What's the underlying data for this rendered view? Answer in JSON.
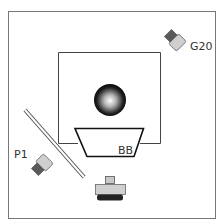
{
  "diagram": {
    "type": "optical-setup",
    "colors": {
      "frame": "#777777",
      "light_body": "#cfcfcf",
      "dark_body": "#5a5a5a",
      "detector_base": "#222222",
      "sphere_dark": "#000000",
      "sphere_light": "#ffffff",
      "trapezoid_stroke": "#111111"
    },
    "labels": {
      "camera_top_right": "G20",
      "camera_left": "P1",
      "trapezoid": "BB"
    },
    "components": [
      {
        "id": "outer-frame",
        "kind": "enclosure"
      },
      {
        "id": "inner-box",
        "kind": "chamber"
      },
      {
        "id": "sphere",
        "kind": "target-sphere"
      },
      {
        "id": "trapezoid",
        "kind": "blackbody",
        "label": "BB"
      },
      {
        "id": "mirror",
        "kind": "diagonal-mirror"
      },
      {
        "id": "camera-g20",
        "kind": "camera",
        "label": "G20"
      },
      {
        "id": "camera-p1",
        "kind": "camera",
        "label": "P1"
      },
      {
        "id": "detector",
        "kind": "detector-bottom"
      }
    ]
  }
}
